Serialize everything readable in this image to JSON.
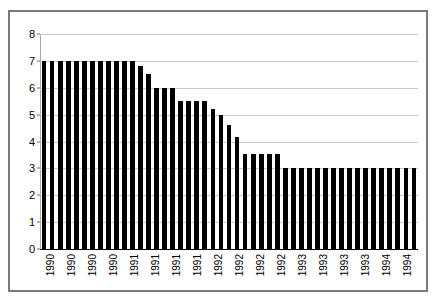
{
  "chart_data": {
    "type": "bar",
    "title": "",
    "subtitle": "",
    "xlabel": "",
    "ylabel": "",
    "ylim": [
      0,
      8
    ],
    "ytick_values": [
      0,
      1,
      2,
      3,
      4,
      5,
      6,
      7,
      8
    ],
    "ytick_labels": [
      "0",
      "1",
      "2",
      "3",
      "4",
      "5",
      "6",
      "7",
      "8"
    ],
    "grid": true,
    "grid_axis": "y",
    "legend": false,
    "legend_position": "none",
    "bar_color": "#000000",
    "plot_background": "#ffffff",
    "frame_color": "#7a7a7a",
    "gridline_color": "#c9c9c9",
    "categories": [
      "1990",
      "1990",
      "1990",
      "1990",
      "1990",
      "1990",
      "1990",
      "1990",
      "1990",
      "1990",
      "1990",
      "1990",
      "1991",
      "1991",
      "1991",
      "1991",
      "1991",
      "1991",
      "1991",
      "1991",
      "1991",
      "1991",
      "1991",
      "1991",
      "1992",
      "1992",
      "1992",
      "1992",
      "1992",
      "1992",
      "1992",
      "1992",
      "1992",
      "1992",
      "1992",
      "1992",
      "1993",
      "1993",
      "1993",
      "1993",
      "1993",
      "1993",
      "1993",
      "1993",
      "1993",
      "1994",
      "1994"
    ],
    "values": [
      7.0,
      7.0,
      7.0,
      7.0,
      7.0,
      7.0,
      7.0,
      7.0,
      7.0,
      7.0,
      7.0,
      7.0,
      6.8,
      6.5,
      6.0,
      6.0,
      6.0,
      5.5,
      5.5,
      5.5,
      5.5,
      5.2,
      5.0,
      4.6,
      4.15,
      3.55,
      3.55,
      3.55,
      3.55,
      3.55,
      3.0,
      3.0,
      3.0,
      3.0,
      3.0,
      3.0,
      3.0,
      3.0,
      3.0,
      3.0,
      3.0,
      3.0,
      3.0,
      3.0,
      3.0,
      3.0,
      3.0
    ],
    "xtick_labels": [
      "1990",
      "1990",
      "1990",
      "1990",
      "1991",
      "1991",
      "1991",
      "1991",
      "1992",
      "1992",
      "1992",
      "1992",
      "1993",
      "1993",
      "1993",
      "1993",
      "1994",
      "1994"
    ],
    "xtick_label_rotation": 90
  }
}
